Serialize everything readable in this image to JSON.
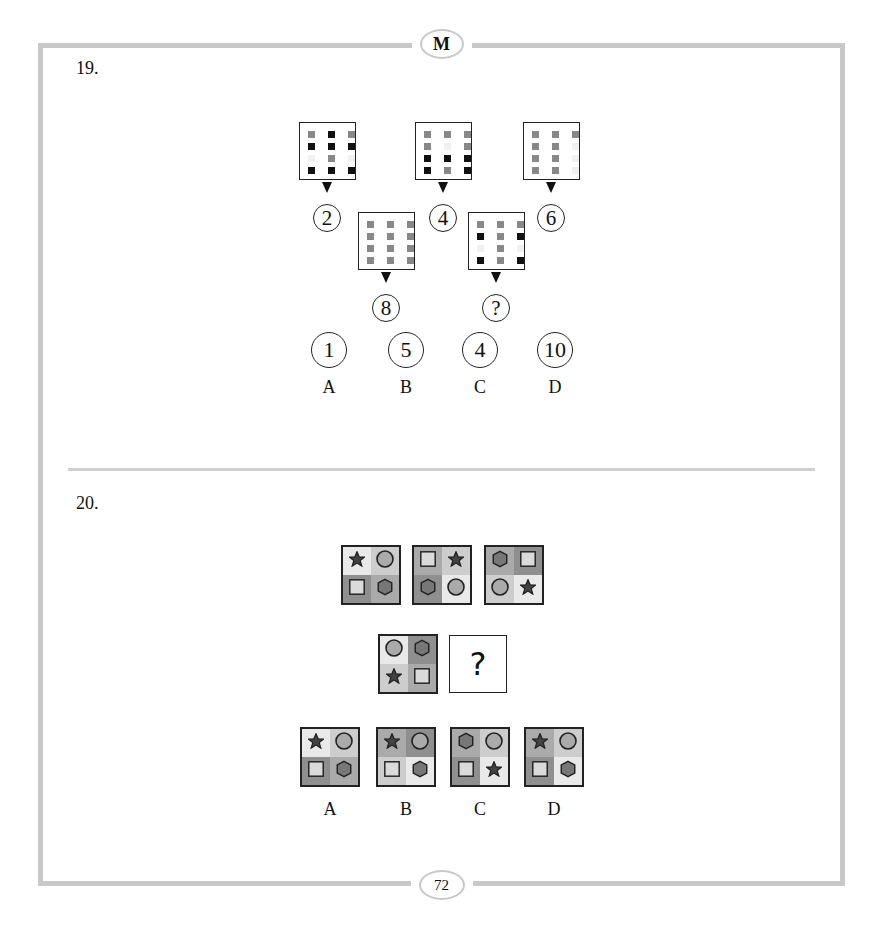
{
  "header": {
    "badge": "M"
  },
  "footer": {
    "page_number": "72"
  },
  "colors": {
    "frame": "#c8c8c8",
    "dot_black": "#111111",
    "dot_gray": "#888888",
    "dot_faint": "#f1f1f1"
  },
  "q19": {
    "number": "19.",
    "grids": [
      {
        "label": "2",
        "cells": [
          [
            "g",
            "k",
            "g"
          ],
          [
            "k",
            "k",
            "k"
          ],
          [
            "w",
            "g",
            "w"
          ],
          [
            "k",
            "k",
            "k"
          ]
        ]
      },
      {
        "label": "4",
        "cells": [
          [
            "g",
            "g",
            "g"
          ],
          [
            "g",
            "w",
            "g"
          ],
          [
            "k",
            "k",
            "k"
          ],
          [
            "k",
            "g",
            "k"
          ]
        ]
      },
      {
        "label": "6",
        "cells": [
          [
            "g",
            "g",
            "g"
          ],
          [
            "g",
            "g",
            "w"
          ],
          [
            "g",
            "g",
            "w"
          ],
          [
            "g",
            "g",
            "w"
          ]
        ]
      },
      {
        "label": "8",
        "cells": [
          [
            "g",
            "g",
            "g"
          ],
          [
            "g",
            "g",
            "g"
          ],
          [
            "g",
            "g",
            "g"
          ],
          [
            "g",
            "g",
            "g"
          ]
        ]
      },
      {
        "label": "?",
        "cells": [
          [
            "g",
            "g",
            "g"
          ],
          [
            "k",
            "g",
            "k"
          ],
          [
            "w",
            "g",
            "w"
          ],
          [
            "k",
            "g",
            "k"
          ]
        ]
      }
    ],
    "options": [
      {
        "letter": "A",
        "value": "1"
      },
      {
        "letter": "B",
        "value": "5"
      },
      {
        "letter": "C",
        "value": "4"
      },
      {
        "letter": "D",
        "value": "10"
      }
    ]
  },
  "q20": {
    "number": "20.",
    "question_mark": "?",
    "sequence": [
      {
        "quads": [
          [
            "star",
            "vl"
          ],
          [
            "circle",
            "l"
          ],
          [
            "square",
            "d"
          ],
          [
            "hexagon",
            "m"
          ]
        ]
      },
      {
        "quads": [
          [
            "square",
            "m"
          ],
          [
            "star",
            "l"
          ],
          [
            "hexagon",
            "d"
          ],
          [
            "circle",
            "vl"
          ]
        ]
      },
      {
        "quads": [
          [
            "hexagon",
            "m"
          ],
          [
            "square",
            "d"
          ],
          [
            "circle",
            "l"
          ],
          [
            "star",
            "vl"
          ]
        ]
      },
      {
        "quads": [
          [
            "circle",
            "vl"
          ],
          [
            "hexagon",
            "d"
          ],
          [
            "star",
            "l"
          ],
          [
            "square",
            "m"
          ]
        ]
      }
    ],
    "options": [
      {
        "letter": "A",
        "quads": [
          [
            "star",
            "vl"
          ],
          [
            "circle",
            "l"
          ],
          [
            "square",
            "d"
          ],
          [
            "hexagon",
            "m"
          ]
        ]
      },
      {
        "letter": "B",
        "quads": [
          [
            "star",
            "m"
          ],
          [
            "circle",
            "d"
          ],
          [
            "square",
            "l"
          ],
          [
            "hexagon",
            "vl"
          ]
        ]
      },
      {
        "letter": "C",
        "quads": [
          [
            "hexagon",
            "m"
          ],
          [
            "circle",
            "l"
          ],
          [
            "square",
            "d"
          ],
          [
            "star",
            "vl"
          ]
        ]
      },
      {
        "letter": "D",
        "quads": [
          [
            "star",
            "m"
          ],
          [
            "circle",
            "l"
          ],
          [
            "square",
            "d"
          ],
          [
            "hexagon",
            "vl"
          ]
        ]
      }
    ]
  }
}
